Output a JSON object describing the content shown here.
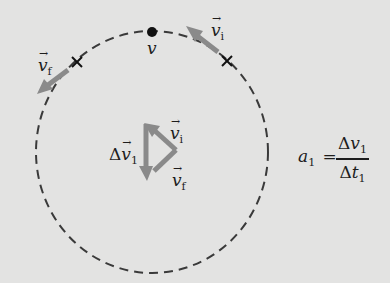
{
  "diagram": {
    "colors": {
      "background": "#e3e3e2",
      "circle": "#3a3a3a",
      "vector": "#8a8a8a",
      "text": "#1d1d1d"
    },
    "labels": {
      "v_top": "v",
      "vi_symbol": "v",
      "vi_sub": "i",
      "vf_symbol": "v",
      "vf_sub": "f",
      "arrow_glyph": "→",
      "delta": "Δ",
      "dv_symbol": "v",
      "dv_sub": "1",
      "tri_vi_symbol": "v",
      "tri_vi_sub": "i",
      "tri_vf_symbol": "v",
      "tri_vf_sub": "f"
    },
    "equation": {
      "lhs_symbol": "a",
      "lhs_sub": "1",
      "equals": "=",
      "num_delta": "Δ",
      "num_symbol": "v",
      "num_sub": "1",
      "den_delta": "Δ",
      "den_symbol": "t",
      "den_sub": "1"
    }
  }
}
